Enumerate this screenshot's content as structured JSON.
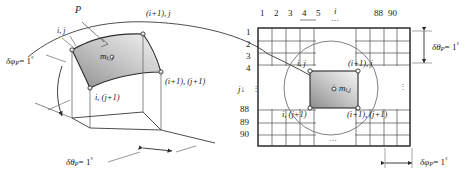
{
  "figure": {
    "type": "technical-diagram"
  },
  "left_panel": {
    "name": "3d-surface-element",
    "labels": {
      "p": "P",
      "corner_top_left": "i, j",
      "corner_top_right": "(i+1), j",
      "corner_bottom_left": "i, (j+1)",
      "corner_bottom_right": "(i+1), (j+1)",
      "mass": "m",
      "mass_sub": "i, j",
      "delta_phi": "δφ",
      "delta_phi_sub": "P",
      "delta_phi_value": "= 1",
      "delta_theta": "δθ",
      "delta_theta_sub": "P",
      "delta_theta_value": "= 1",
      "degree": "°"
    }
  },
  "right_panel": {
    "name": "grid-map",
    "column_header_axis": "i",
    "row_header_axis": "j",
    "row_arrow": "↓",
    "columns_start": [
      "1",
      "2",
      "3",
      "4",
      "5"
    ],
    "columns_end": [
      "88",
      "90"
    ],
    "rows_start": [
      "1",
      "2",
      "3",
      "4"
    ],
    "rows_end": [
      "88",
      "89",
      "90"
    ],
    "ellipsis_horizontal": "⋯",
    "ellipsis_vertical": "⋮",
    "cell_labels": {
      "top_left": "i, j",
      "top_right": "(i+1), j",
      "bottom_left": "i, (j+1)",
      "bottom_right": "(i+1), (j+1)",
      "mass": "m",
      "mass_sub": "i,j"
    },
    "dimensions": {
      "delta_theta": "δθ",
      "delta_theta_sub": "P",
      "delta_theta_value": "= 1",
      "delta_phi": "δφ",
      "delta_phi_sub": "P",
      "delta_phi_value": "= 1",
      "degree": "°"
    }
  },
  "colors": {
    "line": "#2b2b2b",
    "thin_line": "#555555",
    "fill_dark": "#9a9a9a",
    "fill_light": "#f2f2f2",
    "background": "#ffffff"
  }
}
